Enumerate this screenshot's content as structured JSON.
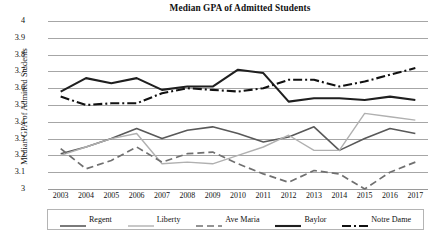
{
  "chart_data": {
    "type": "line",
    "title": "Median GPA of Admitted Students",
    "xlabel": "",
    "ylabel": "Median GPA of Admitted Students",
    "categories": [
      "2003",
      "2004",
      "2005",
      "2006",
      "2007",
      "2008",
      "2009",
      "2010",
      "2011",
      "2012",
      "2013",
      "2014",
      "2015",
      "2016",
      "2017"
    ],
    "x": [
      2003,
      2004,
      2005,
      2006,
      2007,
      2008,
      2009,
      2010,
      2011,
      2012,
      2013,
      2014,
      2015,
      2016,
      2017
    ],
    "ylim": [
      3,
      4
    ],
    "yticks": [
      "3",
      "3.1",
      "3.2",
      "3.3",
      "3.4",
      "3.5",
      "3.6",
      "3.7",
      "3.8",
      "3.9",
      "4"
    ],
    "ytick_values": [
      3,
      3.1,
      3.2,
      3.3,
      3.4,
      3.5,
      3.6,
      3.7,
      3.8,
      3.9,
      4
    ],
    "grid": true,
    "legend_position": "bottom",
    "series": [
      {
        "name": "Regent",
        "color": "#595959",
        "dash": "none",
        "width": 1.6,
        "values": [
          3.21,
          3.25,
          3.3,
          3.36,
          3.3,
          3.35,
          3.37,
          3.33,
          3.28,
          3.31,
          3.37,
          3.23,
          3.3,
          3.36,
          3.33
        ]
      },
      {
        "name": "Liberty",
        "color": "#b0b0b0",
        "dash": "none",
        "width": 1.4,
        "values": [
          3.2,
          3.25,
          3.3,
          3.33,
          3.15,
          3.16,
          3.15,
          3.2,
          3.25,
          3.32,
          3.23,
          3.23,
          3.45,
          3.43,
          3.41
        ]
      },
      {
        "name": "Ave Maria",
        "color": "#707070",
        "dash": "7,4",
        "width": 1.7,
        "values": [
          3.24,
          3.12,
          3.17,
          3.25,
          3.16,
          3.21,
          3.22,
          3.15,
          3.09,
          3.04,
          3.11,
          3.09,
          3.0,
          3.1,
          3.16
        ]
      },
      {
        "name": "Baylor",
        "color": "#1f1f1f",
        "dash": "none",
        "width": 2.1,
        "values": [
          3.58,
          3.66,
          3.63,
          3.66,
          3.59,
          3.61,
          3.61,
          3.71,
          3.69,
          3.52,
          3.54,
          3.54,
          3.53,
          3.55,
          3.53
        ]
      },
      {
        "name": "Notre Dame",
        "color": "#111111",
        "dash": "9,3,2,3",
        "width": 2.1,
        "values": [
          3.55,
          3.5,
          3.51,
          3.51,
          3.57,
          3.6,
          3.59,
          3.58,
          3.6,
          3.65,
          3.65,
          3.61,
          3.64,
          3.68,
          3.72
        ]
      }
    ]
  },
  "legend": {
    "items": [
      {
        "label": "Regent"
      },
      {
        "label": "Liberty"
      },
      {
        "label": "Ave Maria"
      },
      {
        "label": "Baylor"
      },
      {
        "label": "Notre Dame"
      }
    ]
  },
  "caption": {
    "text": ""
  }
}
